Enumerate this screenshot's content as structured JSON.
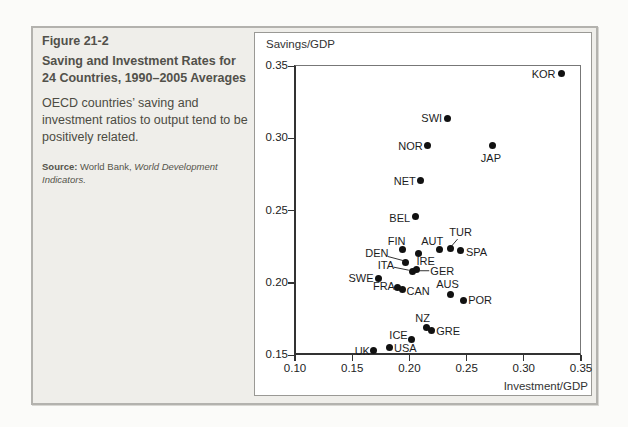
{
  "caption": {
    "figure_label": "Figure 21-2",
    "title": "Saving and Investment Rates for 24 Countries, 1990–2005 Averages",
    "description": "OECD countries’ saving and investment ratios to output tend to be positively related.",
    "source_prefix": "Source:",
    "source_text": " World Bank, ",
    "source_italic": "World Development Indicators."
  },
  "chart_data": {
    "type": "scatter",
    "title": "",
    "dot_color": "#111111",
    "x_axis": {
      "title": "Investment/GDP",
      "min": 0.1,
      "max": 0.35,
      "ticks": [
        0.1,
        0.15,
        0.2,
        0.25,
        0.3,
        0.35
      ],
      "tick_labels": [
        "0.10",
        "0.15",
        "0.20",
        "0.25",
        "0.30",
        "0.35"
      ]
    },
    "y_axis": {
      "title": "Savings/GDP",
      "min": 0.15,
      "max": 0.35,
      "ticks": [
        0.15,
        0.2,
        0.25,
        0.3,
        0.35
      ],
      "tick_labels": [
        "0.15",
        "0.20",
        "0.25",
        "0.30",
        "0.35"
      ]
    },
    "points": [
      {
        "code": "KOR",
        "investment": 0.333,
        "savings": 0.345,
        "align": "end",
        "dx": -6,
        "dy": 1
      },
      {
        "code": "SWI",
        "investment": 0.233,
        "savings": 0.314,
        "align": "end",
        "dx": -5,
        "dy": 0
      },
      {
        "code": "NOR",
        "investment": 0.216,
        "savings": 0.295,
        "align": "end",
        "dx": -5,
        "dy": 1
      },
      {
        "code": "JAP",
        "investment": 0.273,
        "savings": 0.295,
        "align": "middle",
        "dx": -2,
        "dy": 13
      },
      {
        "code": "NET",
        "investment": 0.21,
        "savings": 0.271,
        "align": "end",
        "dx": -5,
        "dy": 1
      },
      {
        "code": "BEL",
        "investment": 0.205,
        "savings": 0.246,
        "align": "end",
        "dx": -5,
        "dy": 2
      },
      {
        "code": "FIN",
        "investment": 0.194,
        "savings": 0.223,
        "align": "middle",
        "dx": -6,
        "dy": -9
      },
      {
        "code": "AUT",
        "investment": 0.226,
        "savings": 0.223,
        "align": "middle",
        "dx": -7,
        "dy": -9
      },
      {
        "code": "TUR",
        "investment": 0.236,
        "savings": 0.224,
        "align": "middle",
        "dx": 10,
        "dy": -16,
        "leader": [
          7,
          -9,
          1,
          -2
        ]
      },
      {
        "code": "SPA",
        "investment": 0.245,
        "savings": 0.222,
        "align": "start",
        "dx": 5,
        "dy": 1
      },
      {
        "code": "IRE",
        "investment": 0.208,
        "savings": 0.22,
        "align": "middle",
        "dx": 7,
        "dy": 7
      },
      {
        "code": "DEN",
        "investment": 0.197,
        "savings": 0.214,
        "align": "middle",
        "dx": -29,
        "dy": -10,
        "leader": [
          -18,
          -6,
          -3,
          -2
        ]
      },
      {
        "code": "ITA",
        "investment": 0.203,
        "savings": 0.208,
        "align": "middle",
        "dx": -27,
        "dy": -6,
        "leader": [
          -19,
          -4,
          -4,
          -1
        ]
      },
      {
        "code": "GER",
        "investment": 0.206,
        "savings": 0.209,
        "align": "middle",
        "dx": 26,
        "dy": 1,
        "leader": [
          3,
          1,
          13,
          1
        ]
      },
      {
        "code": "SWE",
        "investment": 0.173,
        "savings": 0.203,
        "align": "end",
        "dx": -5,
        "dy": 0
      },
      {
        "code": "FRA",
        "investment": 0.19,
        "savings": 0.197,
        "align": "end",
        "dx": -3,
        "dy": -1
      },
      {
        "code": "CAN",
        "investment": 0.194,
        "savings": 0.195,
        "align": "start",
        "dx": 4,
        "dy": 1
      },
      {
        "code": "AUS",
        "investment": 0.236,
        "savings": 0.192,
        "align": "middle",
        "dx": -3,
        "dy": -10
      },
      {
        "code": "POR",
        "investment": 0.247,
        "savings": 0.188,
        "align": "start",
        "dx": 5,
        "dy": 0
      },
      {
        "code": "NZ",
        "investment": 0.215,
        "savings": 0.169,
        "align": "middle",
        "dx": -4,
        "dy": -10
      },
      {
        "code": "GRE",
        "investment": 0.219,
        "savings": 0.167,
        "align": "start",
        "dx": 5,
        "dy": 1
      },
      {
        "code": "ICE",
        "investment": 0.202,
        "savings": 0.161,
        "align": "end",
        "dx": -4,
        "dy": -4
      },
      {
        "code": "UK",
        "investment": 0.169,
        "savings": 0.153,
        "align": "end",
        "dx": -4,
        "dy": 0
      },
      {
        "code": "USA",
        "investment": 0.183,
        "savings": 0.155,
        "align": "start",
        "dx": 4,
        "dy": 0
      }
    ]
  }
}
